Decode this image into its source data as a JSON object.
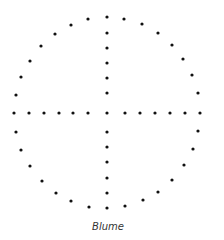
{
  "caption": "Blume",
  "dot_color": "#111111",
  "dot_radius": 1.6,
  "dots": [
    [
      107,
      17
    ],
    [
      88,
      19
    ],
    [
      71,
      25
    ],
    [
      55,
      34
    ],
    [
      41,
      46
    ],
    [
      30,
      61
    ],
    [
      21,
      77
    ],
    [
      16,
      95
    ],
    [
      124,
      19
    ],
    [
      142,
      24
    ],
    [
      158,
      33
    ],
    [
      172,
      45
    ],
    [
      183,
      59
    ],
    [
      192,
      75
    ],
    [
      198,
      93
    ],
    [
      107,
      33
    ],
    [
      107,
      48
    ],
    [
      107,
      63
    ],
    [
      107,
      78
    ],
    [
      107,
      93
    ],
    [
      14,
      113
    ],
    [
      29,
      113
    ],
    [
      44,
      113
    ],
    [
      59,
      113
    ],
    [
      73,
      113
    ],
    [
      88,
      113
    ],
    [
      107,
      113
    ],
    [
      125,
      113
    ],
    [
      140,
      113
    ],
    [
      155,
      113
    ],
    [
      170,
      113
    ],
    [
      185,
      113
    ],
    [
      200,
      113
    ],
    [
      16,
      132
    ],
    [
      21,
      150
    ],
    [
      30,
      166
    ],
    [
      42,
      181
    ],
    [
      56,
      193
    ],
    [
      71,
      201
    ],
    [
      89,
      207
    ],
    [
      107,
      208
    ],
    [
      125,
      206
    ],
    [
      143,
      200
    ],
    [
      158,
      192
    ],
    [
      172,
      180
    ],
    [
      184,
      165
    ],
    [
      193,
      149
    ],
    [
      198,
      131
    ],
    [
      107,
      132
    ],
    [
      107,
      147
    ],
    [
      107,
      162
    ],
    [
      107,
      178
    ],
    [
      107,
      193
    ]
  ]
}
